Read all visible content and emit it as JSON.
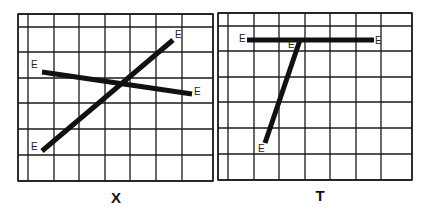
{
  "panels": [
    {
      "id": "X",
      "caption": "X",
      "grid": {
        "x": [
          18,
          28,
          54,
          79,
          105,
          130,
          156,
          182,
          213
        ],
        "y": [
          14,
          27,
          52,
          78,
          103,
          129,
          155,
          181
        ]
      },
      "lines": [
        {
          "x1": 42,
          "y1": 151,
          "x2": 173,
          "y2": 40
        },
        {
          "x1": 42,
          "y1": 72,
          "x2": 192,
          "y2": 94
        }
      ],
      "labels": [
        {
          "text": "E",
          "x": 31,
          "y": 150
        },
        {
          "text": "E",
          "x": 175,
          "y": 38
        },
        {
          "text": "E",
          "x": 31,
          "y": 68
        },
        {
          "text": "E",
          "x": 194,
          "y": 95
        }
      ],
      "caption_pos": {
        "x": 116,
        "y": 203
      }
    },
    {
      "id": "T",
      "caption": "T",
      "grid": {
        "x": [
          218,
          228,
          254,
          279,
          305,
          330,
          356,
          381,
          412
        ],
        "y": [
          13,
          26,
          51,
          77,
          102,
          128,
          154,
          180
        ]
      },
      "lines": [
        {
          "x1": 247,
          "y1": 40,
          "x2": 374,
          "y2": 40
        },
        {
          "x1": 300,
          "y1": 40,
          "x2": 265,
          "y2": 143
        }
      ],
      "labels": [
        {
          "text": "E",
          "x": 239,
          "y": 42
        },
        {
          "text": "E",
          "x": 375,
          "y": 44
        },
        {
          "text": "E",
          "x": 288,
          "y": 48
        },
        {
          "text": "E",
          "x": 258,
          "y": 152
        }
      ],
      "caption_pos": {
        "x": 320,
        "y": 201
      }
    }
  ]
}
